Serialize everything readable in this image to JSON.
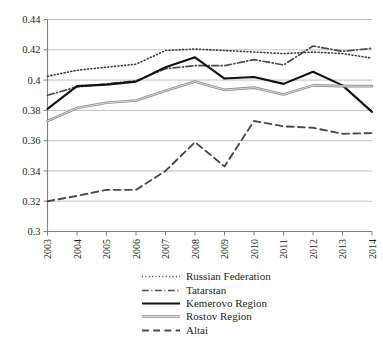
{
  "chart_data": {
    "type": "line",
    "title": "",
    "subtitle": "",
    "xlabel": "",
    "ylabel": "",
    "categories": [
      "2003",
      "2004",
      "2005",
      "2006",
      "2007",
      "2008",
      "2009",
      "2010",
      "2011",
      "2012",
      "2013",
      "2014"
    ],
    "x": [
      2003,
      2004,
      2005,
      2006,
      2007,
      2008,
      2009,
      2010,
      2011,
      2012,
      2013,
      2014
    ],
    "ylim": [
      0.3,
      0.44
    ],
    "ytick_values": [
      0.3,
      0.32,
      0.34,
      0.36,
      0.38,
      0.4,
      0.42,
      0.44
    ],
    "ytick_labels": [
      "0.3",
      "0.32",
      "0.34",
      "0.36",
      "0.38",
      "0.4",
      "0.42",
      "0.44"
    ],
    "grid": true,
    "grid_axis": "y",
    "legend_position": "bottom",
    "xtick_rotation": 90,
    "series": [
      {
        "name": "Russian Federation",
        "style": "dotted",
        "color": "#3b3b3b",
        "width": 1.6,
        "values": [
          0.4025,
          0.4065,
          0.4085,
          0.4105,
          0.4195,
          0.4205,
          0.4195,
          0.4185,
          0.4175,
          0.4185,
          0.4175,
          0.4145
        ]
      },
      {
        "name": "Tatarstan",
        "style": "dash-dot",
        "color": "#4a4a4a",
        "width": 1.7,
        "values": [
          0.39,
          0.3955,
          0.3975,
          0.3995,
          0.4075,
          0.4095,
          0.4095,
          0.4135,
          0.41,
          0.4225,
          0.419,
          0.421
        ]
      },
      {
        "name": "Kemerovo Region",
        "style": "solid",
        "color": "#111111",
        "width": 2.1,
        "values": [
          0.381,
          0.396,
          0.397,
          0.399,
          0.4085,
          0.415,
          0.401,
          0.402,
          0.3975,
          0.4055,
          0.3965,
          0.379
        ]
      },
      {
        "name": "Rostov Region",
        "style": "solid-gray",
        "color": "#8c8c8c",
        "width": 2.6,
        "values": [
          0.373,
          0.3815,
          0.385,
          0.3865,
          0.393,
          0.399,
          0.3935,
          0.395,
          0.3905,
          0.3965,
          0.396,
          0.396
        ]
      },
      {
        "name": "Altai",
        "style": "dashed",
        "color": "#4a4a4a",
        "width": 1.9,
        "values": [
          0.32,
          0.3235,
          0.3275,
          0.3275,
          0.34,
          0.359,
          0.343,
          0.373,
          0.3695,
          0.3685,
          0.3645,
          0.365
        ]
      }
    ]
  },
  "legend": {
    "items": [
      {
        "label": "Russian Federation"
      },
      {
        "label": "Tatarstan"
      },
      {
        "label": "Kemerovo Region"
      },
      {
        "label": "Rostov Region"
      },
      {
        "label": "Altai"
      }
    ]
  }
}
